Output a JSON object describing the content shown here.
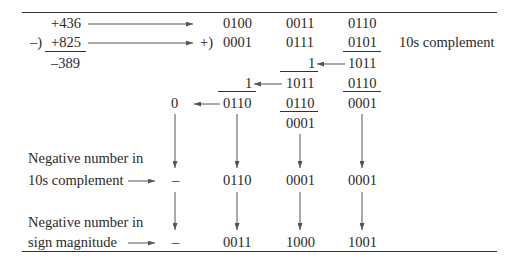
{
  "decimal": {
    "minuend": "+436",
    "subtrahend": "+825",
    "operator": "–)",
    "result": "–389"
  },
  "bcd": {
    "row1": [
      "0100",
      "0011",
      "0110"
    ],
    "add_operator": "+)",
    "row2": [
      "0001",
      "0111",
      "0101"
    ],
    "row2_note": "10s complement",
    "digit3_sum": "1011",
    "digit3_correction": "0110",
    "digit3_result": "0001",
    "digit2_carry_in": "1",
    "digit2_sum": "1011",
    "digit2_correction": "0110",
    "digit2_result": "0001",
    "digit1_carry_in": "1",
    "digit1_result": "0110",
    "final_carry": "0"
  },
  "tens_complement": {
    "label_line1": "Negative number in",
    "label_line2": "10s complement",
    "sign": "–",
    "digits": [
      "0110",
      "0001",
      "0001"
    ]
  },
  "sign_magnitude": {
    "label_line1": "Negative number in",
    "label_line2": "sign magnitude",
    "sign": "–",
    "digits": [
      "0011",
      "1000",
      "1001"
    ]
  }
}
